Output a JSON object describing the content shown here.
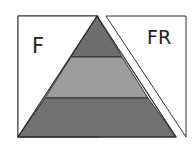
{
  "diagram": {
    "type": "pyramid-with-panels",
    "left_panel": {
      "label": "F"
    },
    "right_panel": {
      "label": "FR"
    },
    "pyramid": {
      "bands": [
        {
          "position": "top",
          "color": "#6f6f6f"
        },
        {
          "position": "middle",
          "color": "#9c9c9c"
        },
        {
          "position": "bottom",
          "color": "#727272"
        }
      ],
      "band_count": 3
    },
    "colors": {
      "background": "#ffffff",
      "outline": "#333333",
      "panel_fill": "#ffffff"
    }
  }
}
